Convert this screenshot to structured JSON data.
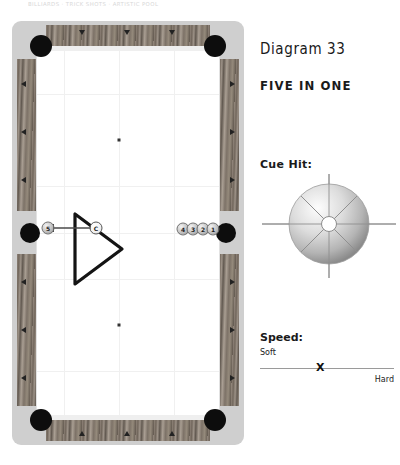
{
  "header": {
    "text": "BILLIARDS  ·  TRICK SHOTS  ·  ARTISTIC POOL"
  },
  "panel": {
    "diagram_number": "Diagram 33",
    "title": "FIVE IN ONE",
    "cue_hit_label": "Cue Hit:",
    "cue_hit_position": "center",
    "speed_label": "Speed:",
    "speed_soft": "Soft",
    "speed_hard": "Hard",
    "speed_marker": "X",
    "speed_marker_percent": 45
  },
  "table": {
    "pockets": [
      {
        "name": "pocket-top-left",
        "type": "corner"
      },
      {
        "name": "pocket-top-right",
        "type": "corner"
      },
      {
        "name": "pocket-bottom-left",
        "type": "corner"
      },
      {
        "name": "pocket-bottom-right",
        "type": "corner"
      },
      {
        "name": "pocket-middle-left",
        "type": "side"
      },
      {
        "name": "pocket-middle-right",
        "type": "side"
      }
    ],
    "spots": [
      {
        "x": 134,
        "y": 131
      },
      {
        "x": 134,
        "y": 322
      }
    ],
    "rack": {
      "shape": "triangle",
      "apex": "right"
    },
    "balls": [
      {
        "label": "5",
        "x": 48,
        "y": 228,
        "type": "object"
      },
      {
        "label": "C",
        "x": 96,
        "y": 228,
        "type": "cue"
      },
      {
        "label": "4",
        "x": 183,
        "y": 229,
        "type": "object"
      },
      {
        "label": "3",
        "x": 193,
        "y": 229,
        "type": "object"
      },
      {
        "label": "2",
        "x": 203,
        "y": 229,
        "type": "object"
      },
      {
        "label": "1",
        "x": 213,
        "y": 229,
        "type": "object"
      }
    ],
    "shot_arrow": {
      "from_x": 89,
      "to_x": 57,
      "y": 228,
      "direction": "left"
    }
  },
  "colors": {
    "rail_wood": "#7a6f64",
    "pocket": "#0d0d0d",
    "bed": "#ffffff",
    "frame": "#cfcfcf",
    "accent": "#111111"
  }
}
